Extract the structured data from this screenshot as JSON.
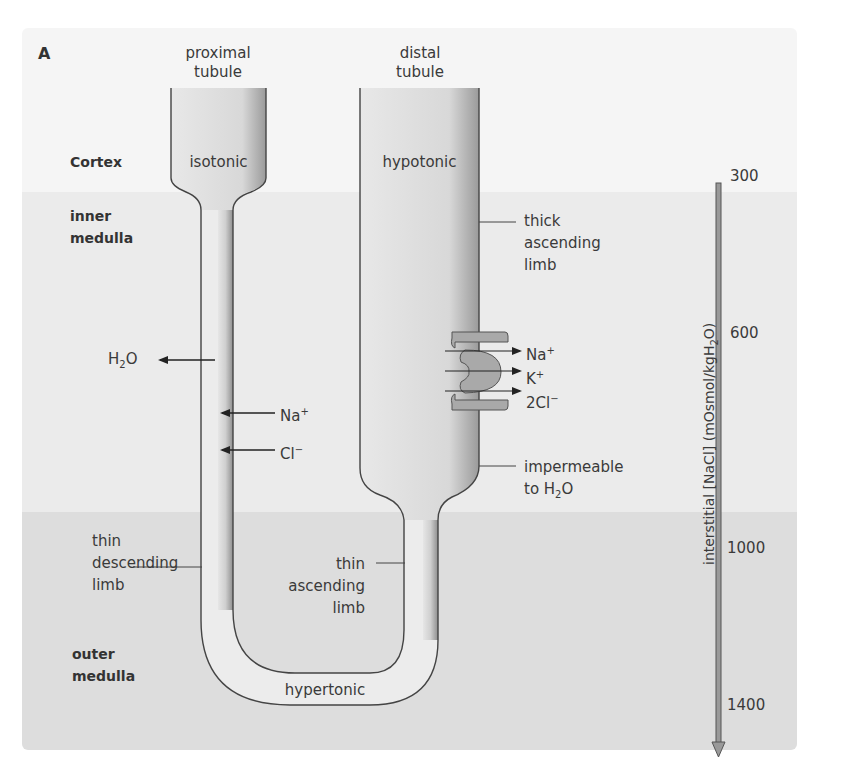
{
  "panel_label": "A",
  "regions": {
    "cortex": "Cortex",
    "inner_medulla": [
      "inner",
      "medulla"
    ],
    "outer_medulla": [
      "outer",
      "medulla"
    ]
  },
  "tubules": {
    "proximal": {
      "title": [
        "proximal",
        "tubule"
      ],
      "tonicity": "isotonic"
    },
    "distal": {
      "title": [
        "distal",
        "tubule"
      ],
      "tonicity": "hypotonic"
    },
    "loop_bottom": "hypertonic"
  },
  "labels": {
    "thick_ascending": [
      "thick",
      "ascending",
      "limb"
    ],
    "impermeable": [
      "impermeable",
      "to H",
      "2",
      "O"
    ],
    "thin_descending": [
      "thin",
      "descending",
      "limb"
    ],
    "thin_ascending": [
      "thin",
      "ascending",
      "limb"
    ]
  },
  "descending_fluxes": [
    {
      "ion": "H",
      "sub": "2",
      "rest": "O",
      "direction": "out-left"
    },
    {
      "ion": "Na",
      "sup": "+",
      "direction": "into-limb"
    },
    {
      "ion": "Cl",
      "sup": "−",
      "direction": "into-limb"
    }
  ],
  "cotransporter": [
    {
      "ion": "Na",
      "sup": "+"
    },
    {
      "ion": "K",
      "sup": "+"
    },
    {
      "ion": "2Cl",
      "sup": "−"
    }
  ],
  "gradient_axis": {
    "label_main": "interstitial [NaCl] (mOsmol/kgH",
    "label_sub": "2",
    "label_end": "O)",
    "ticks": [
      "300",
      "600",
      "1000",
      "1400"
    ]
  },
  "colors": {
    "cortex_bg": "#f5f5f5",
    "inner_medulla_bg": "#ebebeb",
    "outer_medulla_bg": "#dddddd",
    "tubule_fill": "#e6e6e6",
    "transporter_fill": "#a9a9a9"
  }
}
